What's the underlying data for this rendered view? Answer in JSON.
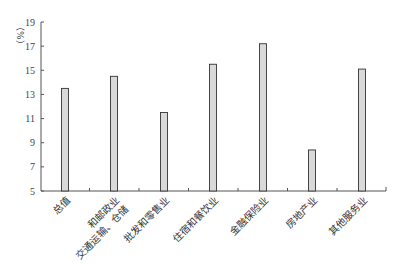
{
  "chart_data": {
    "type": "bar",
    "title": "",
    "xlabel": "",
    "ylabel": "（%）",
    "ylim": [
      5,
      19
    ],
    "yticks": [
      5,
      7,
      9,
      11,
      13,
      15,
      17,
      19
    ],
    "grid": false,
    "legend": null,
    "categories": [
      "总值",
      "交通运输、仓储和邮政业",
      "批发和零售业",
      "住宿和餐饮业",
      "金融保险业",
      "房地产业",
      "其他服务业"
    ],
    "category_display_lines": [
      [
        "总值"
      ],
      [
        "交通运输、仓储",
        "和邮政业"
      ],
      [
        "批发和零售业"
      ],
      [
        "住宿和餐饮业"
      ],
      [
        "金融保险业"
      ],
      [
        "房地产业"
      ],
      [
        "其他服务业"
      ]
    ],
    "values": [
      13.5,
      14.5,
      11.5,
      15.5,
      17.2,
      8.4,
      15.1
    ],
    "bar_fill": "#d9d9d9",
    "bar_stroke": "#333333"
  }
}
